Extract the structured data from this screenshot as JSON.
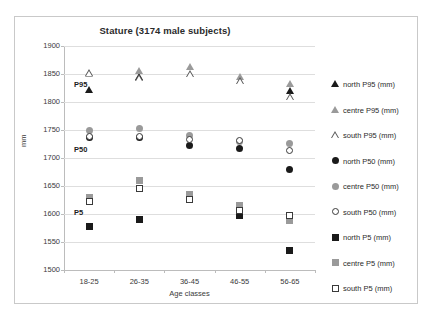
{
  "chart_data": {
    "type": "scatter",
    "title": "Stature  (3174 male subjects)",
    "xlabel": "Age classes",
    "ylabel": "mm",
    "categories": [
      "18-25",
      "26-35",
      "36-45",
      "46-55",
      "56-65"
    ],
    "ylim": [
      1500,
      1900
    ],
    "yticks": [
      1500,
      1550,
      1600,
      1650,
      1700,
      1750,
      1800,
      1850,
      1900
    ],
    "grid": true,
    "legend_position": "right",
    "annotations": [
      {
        "text": "P95",
        "value": 1832
      },
      {
        "text": "P50",
        "value": 1716
      },
      {
        "text": "P5",
        "value": 1604
      }
    ],
    "series": [
      {
        "name": "north P95 (mm)",
        "marker": "tri-filled",
        "values": [
          1822,
          1845,
          null,
          null,
          1820
        ]
      },
      {
        "name": "centre P95 (mm)",
        "marker": "tri-gray",
        "values": [
          1850,
          1855,
          1862,
          1845,
          1832
        ]
      },
      {
        "name": "south P95 (mm)",
        "marker": "tri-open",
        "values": [
          1852,
          1843,
          1850,
          1838,
          1809
        ]
      },
      {
        "name": "north P50 (mm)",
        "marker": "ci-filled",
        "values": [
          1737,
          1737,
          1722,
          1717,
          1680
        ]
      },
      {
        "name": "centre P50 (mm)",
        "marker": "ci-gray",
        "values": [
          1750,
          1752,
          1740,
          1730,
          1726
        ]
      },
      {
        "name": "south P50 (mm)",
        "marker": "ci-open",
        "values": [
          1738,
          1739,
          1733,
          1731,
          1714
        ]
      },
      {
        "name": "north P5 (mm)",
        "marker": "sq-filled",
        "values": [
          1577,
          1590,
          null,
          1597,
          1534
        ]
      },
      {
        "name": "centre P5 (mm)",
        "marker": "sq-gray",
        "values": [
          1630,
          1659,
          1634,
          1615,
          1588
        ]
      },
      {
        "name": "south P5 (mm)",
        "marker": "sq-open",
        "values": [
          1622,
          1645,
          1626,
          1606,
          1597
        ]
      }
    ]
  }
}
